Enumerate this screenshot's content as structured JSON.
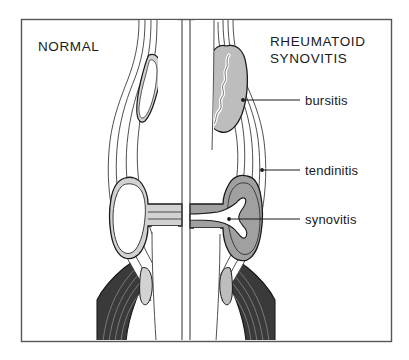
{
  "figure": {
    "kind": "medical-illustration",
    "frame": {
      "x": 21,
      "y": 19,
      "width": 370,
      "height": 322,
      "border_color": "#555555",
      "background_color": "#ffffff"
    },
    "headings": [
      {
        "id": "normal",
        "label": "NORMAL",
        "x": 38,
        "y": 51,
        "align": "start"
      },
      {
        "id": "rheumatoid",
        "label": "RHEUMATOID",
        "x": 270,
        "y": 46,
        "align": "start"
      },
      {
        "id": "synovitis_heading",
        "label": "SYNOVITIS",
        "x": 270,
        "y": 63,
        "align": "start"
      }
    ],
    "callouts": [
      {
        "id": "bursitis",
        "label": "bursitis",
        "text_x": 305,
        "text_y": 105,
        "line_x1": 243,
        "line_y1": 100,
        "line_x2": 300,
        "line_y2": 100,
        "dot_x": 243,
        "dot_y": 100
      },
      {
        "id": "tendinitis",
        "label": "tendinitis",
        "text_x": 305,
        "text_y": 175,
        "line_x1": 262,
        "line_y1": 170,
        "line_x2": 300,
        "line_y2": 170,
        "dot_x": 262,
        "dot_y": 170
      },
      {
        "id": "synovitis",
        "label": "synovitis",
        "text_x": 305,
        "text_y": 224,
        "line_x1": 229,
        "line_y1": 219,
        "line_x2": 300,
        "line_y2": 219,
        "dot_x": 229,
        "dot_y": 219
      }
    ],
    "divider_lines": [
      {
        "id": "divider-left",
        "x": 182,
        "y1": 20,
        "y2": 340
      },
      {
        "id": "divider-right",
        "x": 190,
        "y1": 20,
        "y2": 340
      }
    ],
    "palette": {
      "outline": "#1a1a1a",
      "thin_line": "#3c3c3c",
      "joint_space_light": "#d2d2d2",
      "bursa_fill": "#bdbdbd",
      "pannus_dark": "#a0a0a0",
      "muscle_dark": "#3a3a3a",
      "muscle_stripe": "#8d8d8d",
      "white": "#ffffff",
      "text": "#1a1a1a"
    },
    "panels": [
      {
        "id": "normal-panel",
        "title": "NORMAL",
        "side": "left",
        "structures": [
          {
            "name": "bursa",
            "state": "thin normal sliver"
          },
          {
            "name": "tendon-sheath",
            "state": "slim, few layers"
          },
          {
            "name": "joint-space",
            "state": "narrow light synovial space"
          },
          {
            "name": "bone",
            "state": "white shaft"
          },
          {
            "name": "muscle",
            "state": "dark striated belly"
          }
        ]
      },
      {
        "id": "rheumatoid-panel",
        "title": "RHEUMATOID SYNOVITIS",
        "side": "right",
        "structures": [
          {
            "name": "bursa",
            "state": "enlarged, inflamed, wavy interior"
          },
          {
            "name": "tendon-sheath",
            "state": "thickened, multi-layered"
          },
          {
            "name": "joint-space",
            "state": "dark pannus invading joint"
          },
          {
            "name": "bone",
            "state": "white shaft with erosion"
          },
          {
            "name": "muscle",
            "state": "dark striated belly"
          }
        ]
      }
    ]
  }
}
